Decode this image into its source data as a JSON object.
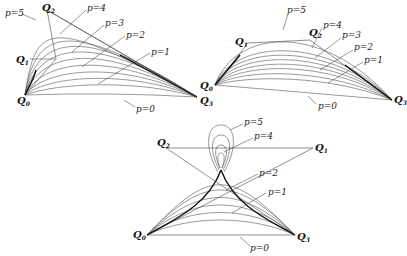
{
  "figures": [
    {
      "id": "fig-left",
      "points": {
        "Q0": "Q",
        "Q1": "Q",
        "Q2": "Q",
        "Q3": "Q"
      },
      "point_labels": [
        {
          "name": "Q0",
          "text": "Q",
          "sub": "0"
        },
        {
          "name": "Q1",
          "text": "Q",
          "sub": "1"
        },
        {
          "name": "Q2",
          "text": "Q",
          "sub": "2"
        },
        {
          "name": "Q3",
          "text": "Q",
          "sub": "3"
        }
      ],
      "param_labels": [
        "p=5",
        "p=4",
        "p=3",
        "p=2",
        "p=1",
        "p=0"
      ]
    },
    {
      "id": "fig-right",
      "point_labels": [
        {
          "name": "Q0",
          "text": "Q",
          "sub": "0"
        },
        {
          "name": "Q1",
          "text": "Q",
          "sub": "1"
        },
        {
          "name": "Q2",
          "text": "Q",
          "sub": "2"
        },
        {
          "name": "Q3",
          "text": "Q",
          "sub": "3"
        }
      ],
      "param_labels": [
        "p=5",
        "p=4",
        "p=3",
        "p=2",
        "p=1",
        "p=0"
      ]
    },
    {
      "id": "fig-bottom",
      "point_labels": [
        {
          "name": "Q0",
          "text": "Q",
          "sub": "0"
        },
        {
          "name": "Q1",
          "text": "Q",
          "sub": "1"
        },
        {
          "name": "Q2",
          "text": "Q",
          "sub": "2"
        },
        {
          "name": "Q3",
          "text": "Q",
          "sub": "3"
        }
      ],
      "param_labels": [
        "p=5",
        "p=4",
        "p=2",
        "p=1",
        "p=0"
      ]
    }
  ],
  "labels": {
    "L": {
      "p5": "p=5",
      "p4": "p=4",
      "p3": "p=3",
      "p2": "p=2",
      "p1": "p=1",
      "p0": "p=0"
    },
    "R": {
      "p5": "p=5",
      "p4": "p=4",
      "p3": "p=3",
      "p2": "p=2",
      "p1": "p=1",
      "p0": "p=0"
    },
    "B": {
      "p5": "p=5",
      "p4": "p=4",
      "p2": "p=2",
      "p1": "p=1",
      "p0": "p=0"
    },
    "Q": "Q",
    "s0": "0",
    "s1": "1",
    "s2": "2",
    "s3": "3"
  }
}
